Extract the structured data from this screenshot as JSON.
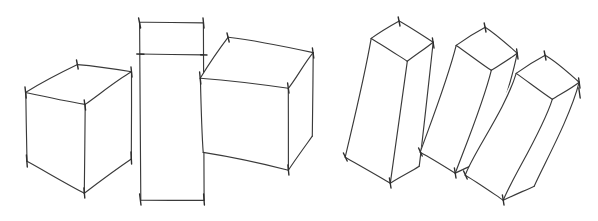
{
  "image": {
    "title": "Hand-drawn perspective sketch of six rectangular solids",
    "medium": "pen and ink line drawing",
    "background_color": "#ffffff",
    "line_color": "#3a3a3a",
    "width": 598,
    "height": 221,
    "object_count": 6,
    "caption": ""
  },
  "groups": [
    {
      "name": "left-group-cubes",
      "label": "Three upright box forms",
      "count": 3
    },
    {
      "name": "right-group-bars",
      "label": "Three tilted elongated bars",
      "count": 3
    }
  ],
  "shapes": [
    {
      "name": "cube-one",
      "label": "Cube, three-quarter view from above left",
      "group": "left-group-cubes",
      "top_face": "26,93 77,65 131,72 85,104",
      "front_left_face": "26,93 85,104 84,193 27,161",
      "front_right_face": "85,104 131,72 131,159 84,193",
      "vertices": "26,93 77,65 131,72 85,104 27,161 84,193 131,159"
    },
    {
      "name": "tall-box",
      "label": "Tall upright rectangular box with lid line",
      "group": "left-group-cubes",
      "outline": "140,22 203,23 204,200 141,200",
      "lid_line": "140,54 203,55",
      "vertices": "140,22 203,23 204,200 141,200"
    },
    {
      "name": "cube-three",
      "label": "Tilted cube, viewed from above right",
      "group": "left-group-cubes",
      "top_face": "200,78 228,37 313,53 288,88",
      "front_left_face": "200,78 288,88 288,170 203,152",
      "front_right_face": "288,88 313,53 312,136 288,170",
      "vertices": "200,78 228,37 313,53 288,88 203,152 288,170 312,136"
    },
    {
      "name": "bar-one",
      "label": "Long bar tilted left, leftmost of the three",
      "group": "right-group-bars",
      "top_face": "371,38 399,21 433,42 407,61",
      "front_face": "371,38 407,61 390,183 345,157",
      "side_face": "407,61 433,42 419,166 390,183",
      "vertices": "371,38 399,21 433,42 407,61 345,157 390,183 419,166"
    },
    {
      "name": "bar-two",
      "label": "Long bar tilted left, middle of the three",
      "group": "right-group-bars",
      "top_face": "456,45 485,27 517,53 491,70",
      "front_face": "456,45 491,70 455,173 420,152",
      "side_face": "491,70 517,53 483,160 455,173",
      "vertices": "456,45 485,27 517,53 491,70 420,152 455,173 483,160"
    },
    {
      "name": "bar-three",
      "label": "Long bar tilted left, rightmost of the three",
      "group": "right-group-bars",
      "top_face": "516,73 545,55 579,82 552,99",
      "front_face": "516,73 552,99 503,200 465,175",
      "side_face": "552,99 579,82 534,186 503,200",
      "vertices": "516,73 545,55 579,82 552,99 465,175 503,200 534,186"
    }
  ]
}
